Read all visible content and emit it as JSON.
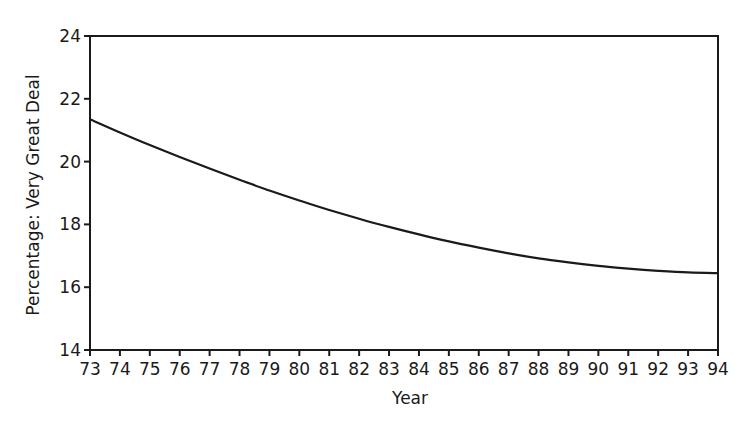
{
  "chart_data": {
    "type": "line",
    "title": "",
    "xlabel": "Year",
    "ylabel": "Percentage: Very Great Deal",
    "x": [
      73,
      74,
      75,
      76,
      77,
      78,
      79,
      80,
      81,
      82,
      83,
      84,
      85,
      86,
      87,
      88,
      89,
      90,
      91,
      92,
      93,
      94
    ],
    "x_tick_labels": [
      "73",
      "74",
      "75",
      "76",
      "77",
      "78",
      "79",
      "80",
      "81",
      "82",
      "83",
      "84",
      "85",
      "86",
      "87",
      "88",
      "89",
      "90",
      "91",
      "92",
      "93",
      "94"
    ],
    "y_ticks": [
      14,
      16,
      18,
      20,
      22,
      24
    ],
    "y_tick_labels": [
      "14",
      "16",
      "18",
      "20",
      "22",
      "24"
    ],
    "xlim": [
      73,
      94
    ],
    "ylim": [
      14,
      24
    ],
    "grid": false,
    "legend": null,
    "series": [
      {
        "name": "Very Great Deal",
        "color": "#1a1a1a",
        "values": [
          21.35,
          20.93,
          20.53,
          20.15,
          19.78,
          19.42,
          19.08,
          18.76,
          18.46,
          18.18,
          17.92,
          17.68,
          17.46,
          17.26,
          17.08,
          16.92,
          16.79,
          16.68,
          16.59,
          16.52,
          16.47,
          16.45
        ]
      }
    ]
  }
}
